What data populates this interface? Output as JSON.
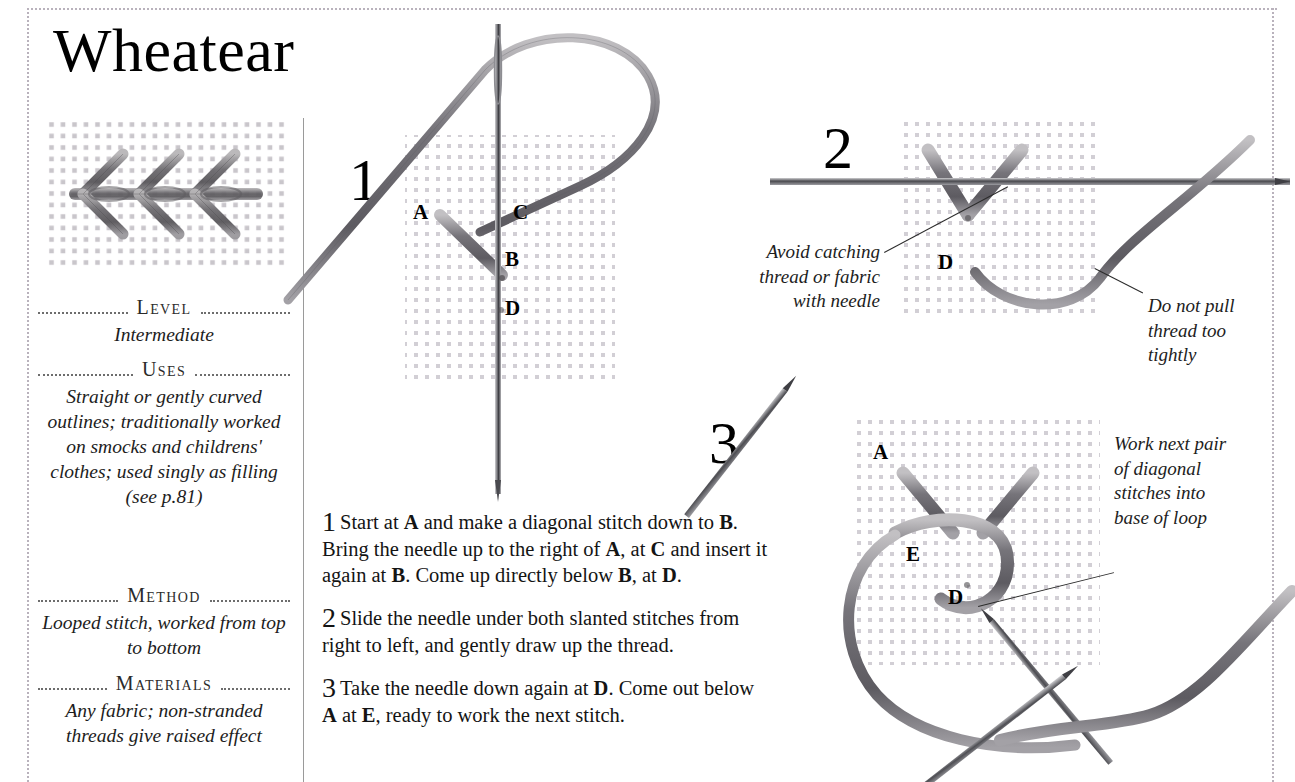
{
  "page": {
    "title": "Wheatear",
    "accent_thread": "#8a8a8a",
    "rule_color": "#b9b2bc",
    "text_color": "#1a1a1a"
  },
  "sidebar": {
    "swatch_name": "wheatear-stitch-sample",
    "sections": [
      {
        "heading": "Level",
        "body": "Intermediate"
      },
      {
        "heading": "Uses",
        "body": "Straight or gently curved outlines; traditionally worked on smocks and childrens' clothes; used singly as filling (see p.81)"
      },
      {
        "heading": "Method",
        "body": "Looped stitch, worked from top to bottom"
      },
      {
        "heading": "Materials",
        "body": "Any fabric; non-stranded threads give raised effect"
      }
    ]
  },
  "diagrams": [
    {
      "number": "1",
      "labels": [
        "A",
        "C",
        "B",
        "D"
      ]
    },
    {
      "number": "2",
      "labels": [
        "D"
      ]
    },
    {
      "number": "3",
      "labels": [
        "A",
        "E",
        "D"
      ]
    }
  ],
  "steps": [
    {
      "number": "1",
      "text_parts": [
        "Start at ",
        "A",
        " and make a diagonal stitch down to ",
        "B",
        ". Bring the needle up to the right of ",
        "A",
        ", at ",
        "C",
        " and insert it again at ",
        "B",
        ". Come up directly below ",
        "B",
        ", at ",
        "D",
        "."
      ]
    },
    {
      "number": "2",
      "text_parts": [
        "Slide the needle under both slanted stitches from right to left, and gently draw up the thread."
      ]
    },
    {
      "number": "3",
      "text_parts": [
        "Take the needle down again at ",
        "D",
        ". Come out below ",
        "A",
        " at ",
        "E",
        ", ready to work the next stitch."
      ]
    }
  ],
  "callouts": [
    {
      "name": "avoid-catching",
      "text": "Avoid catching thread or fabric with needle"
    },
    {
      "name": "do-not-pull",
      "text": "Do not pull thread too tightly"
    },
    {
      "name": "work-next-pair",
      "text": "Work next pair of diagonal stitches into base of loop"
    }
  ]
}
